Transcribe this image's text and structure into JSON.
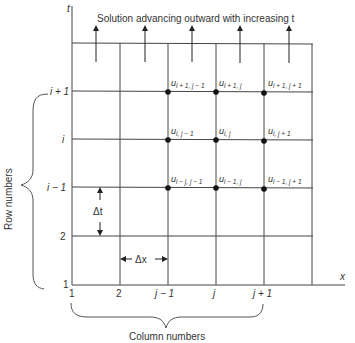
{
  "diagram": {
    "title": "Solution advancing outward with increasing t",
    "axes": {
      "vertical": "t",
      "horizontal": "x"
    },
    "row_labels": [
      "i + 1",
      "i",
      "i − 1",
      "2",
      "1"
    ],
    "column_labels": [
      "1",
      "2",
      "j − 1",
      "j",
      "j + 1"
    ],
    "row_brace_label": "Row numbers",
    "column_brace_label": "Column numbers",
    "delta_t": "Δt",
    "delta_x": "Δx",
    "nodes": [
      {
        "base": "u",
        "sub": "i + 1, j − 1"
      },
      {
        "base": "u",
        "sub": "i + 1, j"
      },
      {
        "base": "u",
        "sub": "i + 1, j + 1"
      },
      {
        "base": "u",
        "sub": "i, j − 1"
      },
      {
        "base": "u",
        "sub": "i, j"
      },
      {
        "base": "u",
        "sub": "i, j + 1"
      },
      {
        "base": "u",
        "sub": "i − j, j − 1"
      },
      {
        "base": "u",
        "sub": "i − 1, j"
      },
      {
        "base": "u",
        "sub": "i − 1, j + 1"
      }
    ]
  }
}
